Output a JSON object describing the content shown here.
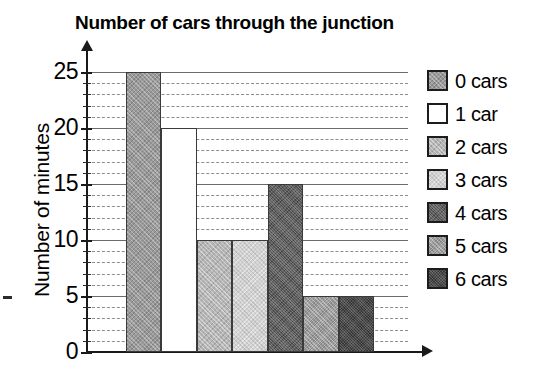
{
  "chart_data": {
    "type": "bar",
    "title": "Number of cars through the junction",
    "xlabel": "",
    "ylabel": "Number of minutes",
    "categories": [
      "0 cars",
      "1 car",
      "2 cars",
      "3 cars",
      "4 cars",
      "5 cars",
      "6 cars"
    ],
    "values": [
      25,
      20,
      10,
      10,
      15,
      5,
      5
    ],
    "ylim": [
      0,
      25
    ],
    "y_ticks": [
      0,
      5,
      10,
      15,
      20,
      25
    ],
    "y_tick_labels": [
      "0",
      "5",
      "10",
      "15",
      "20",
      "25"
    ],
    "y_minor_tick_interval": 1,
    "grid": true,
    "grid_orientation": "horizontal",
    "legend_position": "right",
    "legend": [
      {
        "label": "0 cars",
        "value": 25,
        "color": "#9a9a9a",
        "texture": "cross-hatch-medium"
      },
      {
        "label": "1 car",
        "value": 20,
        "color": "#ffffff",
        "texture": "solid-white"
      },
      {
        "label": "2 cars",
        "value": 10,
        "color": "#b5b5b5",
        "texture": "cross-hatch-light"
      },
      {
        "label": "3 cars",
        "value": 10,
        "color": "#d2d2d2",
        "texture": "cross-hatch-very-light"
      },
      {
        "label": "4 cars",
        "value": 15,
        "color": "#5c5c5c",
        "texture": "noise-dark"
      },
      {
        "label": "5 cars",
        "value": 5,
        "color": "#a3a3a3",
        "texture": "cross-hatch-medium-light"
      },
      {
        "label": "6 cars",
        "value": 5,
        "color": "#4a4a4a",
        "texture": "noise-very-dark"
      }
    ],
    "axis_style": {
      "y_axis_arrow": true,
      "x_axis_arrow": true,
      "axis_color": "#1a1a1a",
      "gridline_color": "#8d8d8d"
    }
  }
}
